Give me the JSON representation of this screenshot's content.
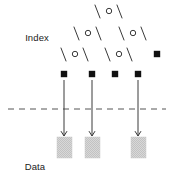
{
  "figure": {
    "type": "diagram",
    "subtitle": "B-tree index over a data file",
    "width": 171,
    "height": 174,
    "background": "#ffffff",
    "stroke_color": "#3a3a3a",
    "node_fill": "#ffffff",
    "pointer_fill": "#111111",
    "block_fill": "#d4d4d4",
    "dashed_color": "#555555"
  },
  "labels": {
    "index": "Index",
    "data_file_line1": "Data",
    "data_file_line2": "file"
  },
  "icons": {
    "internal_node": "circle-node-icon",
    "pointer_node": "filled-square-icon",
    "edge": "tree-edge-icon",
    "arrow": "down-arrow-icon",
    "separator": "dashed-separator-icon",
    "block": "data-block-icon"
  },
  "tree": {
    "levels": [
      {
        "level": 0,
        "name": "root",
        "nodes": [
          {
            "id": "r",
            "shape": "circle",
            "cx": 109,
            "cy": 11
          }
        ]
      },
      {
        "level": 1,
        "name": "internal-1",
        "nodes": [
          {
            "id": "i1",
            "shape": "circle",
            "cx": 88,
            "cy": 33
          },
          {
            "id": "i2",
            "shape": "circle",
            "cx": 133,
            "cy": 33
          }
        ]
      },
      {
        "level": 2,
        "name": "internal-2",
        "nodes": [
          {
            "id": "j1",
            "shape": "circle",
            "cx": 75,
            "cy": 54
          },
          {
            "id": "j2",
            "shape": "circle",
            "cx": 119,
            "cy": 54
          },
          {
            "id": "p0",
            "shape": "square",
            "cx": 157,
            "cy": 54
          }
        ]
      },
      {
        "level": 3,
        "name": "leaf-pointers",
        "nodes": [
          {
            "id": "p1",
            "shape": "square",
            "cx": 64,
            "cy": 74
          },
          {
            "id": "p2",
            "shape": "square",
            "cx": 92,
            "cy": 74
          },
          {
            "id": "p3",
            "shape": "square",
            "cx": 115,
            "cy": 74
          },
          {
            "id": "p4",
            "shape": "square",
            "cx": 138,
            "cy": 74
          }
        ]
      }
    ],
    "edges": [
      {
        "from": "r",
        "x1": 100,
        "y1": 18,
        "x2": 95,
        "y2": 5,
        "dir": "left"
      },
      {
        "from": "r",
        "x1": 117,
        "y1": 5,
        "x2": 122,
        "y2": 18,
        "dir": "right"
      },
      {
        "from": "i1",
        "x1": 79,
        "y1": 40,
        "x2": 74,
        "y2": 27,
        "dir": "left"
      },
      {
        "from": "i1",
        "x1": 96,
        "y1": 27,
        "x2": 101,
        "y2": 40,
        "dir": "right"
      },
      {
        "from": "i2",
        "x1": 124,
        "y1": 40,
        "x2": 119,
        "y2": 27,
        "dir": "left"
      },
      {
        "from": "i2",
        "x1": 141,
        "y1": 27,
        "x2": 146,
        "y2": 40,
        "dir": "right"
      },
      {
        "from": "j1",
        "x1": 66,
        "y1": 61,
        "x2": 61,
        "y2": 48,
        "dir": "left"
      },
      {
        "from": "j1",
        "x1": 83,
        "y1": 48,
        "x2": 88,
        "y2": 61,
        "dir": "right"
      },
      {
        "from": "j2",
        "x1": 110,
        "y1": 61,
        "x2": 105,
        "y2": 48,
        "dir": "left"
      },
      {
        "from": "j2",
        "x1": 127,
        "y1": 48,
        "x2": 132,
        "y2": 61,
        "dir": "right"
      }
    ]
  },
  "separator": {
    "y": 109,
    "x_start": 8,
    "x_end": 166,
    "dash": "6 5"
  },
  "arrows": [
    {
      "id": "a1",
      "x": 64,
      "y_top": 80,
      "y_bottom": 136
    },
    {
      "id": "a2",
      "x": 92,
      "y_top": 80,
      "y_bottom": 136
    },
    {
      "id": "a3",
      "x": 138,
      "y_top": 80,
      "y_bottom": 136
    }
  ],
  "blocks": [
    {
      "id": "b1",
      "x": 57,
      "y": 137,
      "w": 15,
      "h": 21
    },
    {
      "id": "b2",
      "x": 85,
      "y": 137,
      "w": 15,
      "h": 21
    },
    {
      "id": "b3",
      "x": 131,
      "y": 137,
      "w": 15,
      "h": 21
    }
  ]
}
